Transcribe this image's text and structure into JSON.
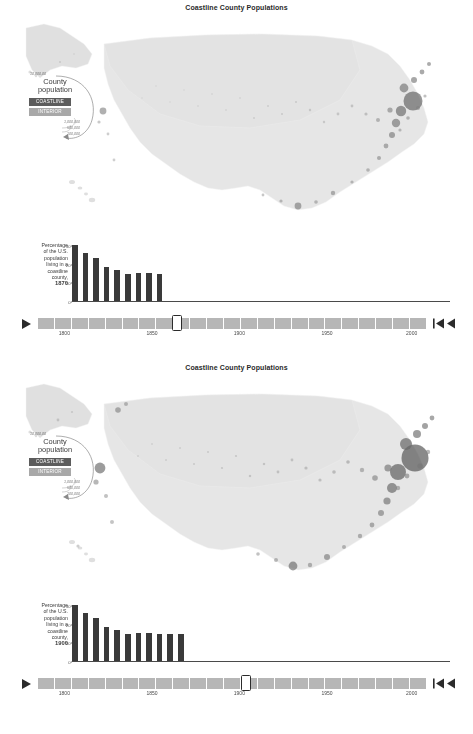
{
  "page": {
    "background": "#ffffff",
    "accent_coastline": "#5c5c5c",
    "accent_interior": "#a8a8a8",
    "bar_color": "#3a3a3a",
    "track_color": "#b6b6b6"
  },
  "panels": [
    {
      "title": "Coastline County Populations",
      "legend": {
        "top_value": "10,000,00",
        "title": "County population",
        "categories": [
          {
            "label": "COASTLINE",
            "color": "#5c5c5c"
          },
          {
            "label": "INTERIOR",
            "color": "#a8a8a8"
          }
        ],
        "scale_values": [
          "1,000,000",
          "500,000",
          "100,000"
        ]
      },
      "chart": {
        "caption_lines": [
          "Percentage",
          "of the U.S.",
          "population",
          "living in a",
          "coastline",
          "county,"
        ],
        "caption_year": "1870"
      },
      "chart_data": {
        "type": "bar",
        "title": "Percentage of the U.S. population living in a coastline county, 1870",
        "categories": [
          "1790",
          "1800",
          "1810",
          "1820",
          "1830",
          "1840",
          "1850",
          "1860",
          "1870"
        ],
        "values": [
          30.4,
          26.3,
          23.3,
          18.8,
          17.3,
          15.2,
          15.3,
          15.3,
          15.0
        ],
        "xlabel": "",
        "ylabel": "",
        "ylim": [
          0,
          32
        ],
        "yticks": [
          0,
          10,
          20,
          30
        ],
        "ytick_labels": [
          "0",
          "10",
          "20",
          "30"
        ],
        "grid": false,
        "legend": "none"
      },
      "timeline": {
        "play_icon": "play-icon",
        "rewind_icon": "skip-back-icon",
        "selected_year": "1870",
        "handle_fraction": 0.3555,
        "segments": 23,
        "ticks": [
          {
            "label": "1800",
            "fraction": 0.068
          },
          {
            "label": "1850",
            "fraction": 0.294
          },
          {
            "label": "1900",
            "fraction": 0.519
          },
          {
            "label": "1950",
            "fraction": 0.745
          },
          {
            "label": "2000",
            "fraction": 0.963
          }
        ]
      }
    },
    {
      "title": "Coastline County Populations",
      "legend": {
        "top_value": "10,000,00",
        "title": "County population",
        "categories": [
          {
            "label": "COASTLINE",
            "color": "#5c5c5c"
          },
          {
            "label": "INTERIOR",
            "color": "#a8a8a8"
          }
        ],
        "scale_values": [
          "1,000,000",
          "500,000",
          "100,000"
        ]
      },
      "chart": {
        "caption_lines": [
          "Percentage",
          "of the U.S.",
          "population",
          "living in a",
          "coastline",
          "county,"
        ],
        "caption_year": "1900"
      },
      "chart_data": {
        "type": "bar",
        "title": "Percentage of the U.S. population living in a coastline county, 1900",
        "categories": [
          "1790",
          "1800",
          "1810",
          "1820",
          "1830",
          "1840",
          "1850",
          "1860",
          "1870",
          "1880",
          "1890"
        ],
        "values": [
          30.4,
          26.3,
          23.3,
          18.8,
          17.3,
          15.2,
          15.3,
          15.3,
          15.0,
          14.8,
          14.9
        ],
        "xlabel": "",
        "ylabel": "",
        "ylim": [
          0,
          32
        ],
        "yticks": [
          0,
          10,
          20,
          30
        ],
        "ytick_labels": [
          "0",
          "10",
          "20",
          "30"
        ],
        "grid": false,
        "legend": "none"
      },
      "timeline": {
        "play_icon": "play-icon",
        "rewind_icon": "skip-back-icon",
        "selected_year": "1900",
        "handle_fraction": 0.5325,
        "segments": 23,
        "ticks": [
          {
            "label": "1800",
            "fraction": 0.068
          },
          {
            "label": "1850",
            "fraction": 0.294
          },
          {
            "label": "1900",
            "fraction": 0.519
          },
          {
            "label": "1950",
            "fraction": 0.745
          },
          {
            "label": "2000",
            "fraction": 0.963
          }
        ]
      }
    }
  ]
}
